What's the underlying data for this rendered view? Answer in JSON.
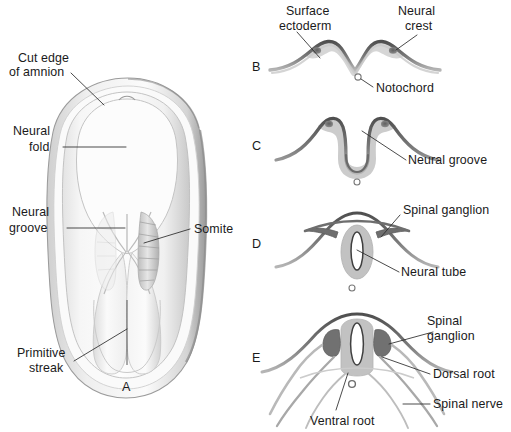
{
  "figure": {
    "background_color": "#ffffff",
    "ink_color": "#1a1a1a",
    "shade_colors": {
      "ectoderm_dark": "#5c5c5c",
      "ectoderm_mid": "#8d8d8d",
      "neural_light": "#cfcfcf",
      "neural_mid": "#b4b4b4",
      "embryo_light": "#f2f2f2",
      "embryo_shadow": "#d8d8d8",
      "crest_dark": "#6e6e6e"
    }
  },
  "panels": [
    {
      "id": "A",
      "letter": "A",
      "caption": "Dorsal view of embryo with cut amnion",
      "labels": [
        {
          "name": "cut-edge-of-amnion",
          "line1": "Cut edge",
          "line2": "of amnion"
        },
        {
          "name": "neural-fold",
          "line1": "Neural",
          "line2": "fold"
        },
        {
          "name": "neural-groove",
          "line1": "Neural",
          "line2": "groove"
        },
        {
          "name": "somite",
          "line1": "Somite",
          "line2": ""
        },
        {
          "name": "primitive-streak",
          "line1": "Primitive",
          "line2": "streak"
        }
      ]
    },
    {
      "id": "B",
      "letter": "B",
      "caption": "Neural plate stage transverse section",
      "labels": [
        {
          "name": "surface-ectoderm",
          "line1": "Surface",
          "line2": "ectoderm"
        },
        {
          "name": "neural-crest",
          "line1": "Neural",
          "line2": "crest"
        },
        {
          "name": "notochord",
          "line1": "Notochord",
          "line2": ""
        }
      ]
    },
    {
      "id": "C",
      "letter": "C",
      "caption": "Neural groove stage transverse section",
      "labels": [
        {
          "name": "neural-groove",
          "line1": "Neural groove",
          "line2": ""
        }
      ]
    },
    {
      "id": "D",
      "letter": "D",
      "caption": "Neural tube closure transverse section",
      "labels": [
        {
          "name": "spinal-ganglion",
          "line1": "Spinal ganglion",
          "line2": ""
        },
        {
          "name": "neural-tube",
          "line1": "Neural tube",
          "line2": ""
        }
      ]
    },
    {
      "id": "E",
      "letter": "E",
      "caption": "Spinal nerve formation transverse section",
      "labels": [
        {
          "name": "spinal-ganglion",
          "line1": "Spinal",
          "line2": "ganglion"
        },
        {
          "name": "dorsal-root",
          "line1": "Dorsal root",
          "line2": ""
        },
        {
          "name": "spinal-nerve",
          "line1": "Spinal nerve",
          "line2": ""
        },
        {
          "name": "ventral-root",
          "line1": "Ventral root",
          "line2": ""
        }
      ]
    }
  ],
  "text": {
    "a_cut_edge_l1": "Cut edge",
    "a_cut_edge_l2": "of amnion",
    "a_neural_fold_l1": "Neural",
    "a_neural_fold_l2": "fold",
    "a_neural_groove_l1": "Neural",
    "a_neural_groove_l2": "groove",
    "a_somite": "Somite",
    "a_primitive_l1": "Primitive",
    "a_primitive_l2": "streak",
    "a_letter": "A",
    "b_surface_l1": "Surface",
    "b_surface_l2": "ectoderm",
    "b_crest_l1": "Neural",
    "b_crest_l2": "crest",
    "b_notochord": "Notochord",
    "b_letter": "B",
    "c_neural_groove": "Neural groove",
    "c_letter": "C",
    "d_spinal_ganglion": "Spinal ganglion",
    "d_neural_tube": "Neural tube",
    "d_letter": "D",
    "e_spinal_ganglion_l1": "Spinal",
    "e_spinal_ganglion_l2": "ganglion",
    "e_dorsal_root": "Dorsal root",
    "e_spinal_nerve": "Spinal nerve",
    "e_ventral_root": "Ventral root",
    "e_letter": "E"
  }
}
